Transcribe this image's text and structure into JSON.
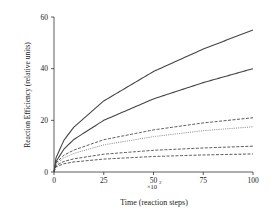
{
  "chart_data": {
    "type": "line",
    "title": "",
    "xlabel": "Time (reaction steps)",
    "x_multiplier": "x10^2",
    "x_multiplier_base": "×10",
    "x_multiplier_exp": "2",
    "ylabel": "Reaction Efficiency  (relative units)",
    "xlim": [
      0,
      100
    ],
    "ylim": [
      0,
      60
    ],
    "xticks": [
      0,
      25,
      50,
      75,
      100
    ],
    "yticks": [
      0,
      20,
      40,
      60
    ],
    "grid": false,
    "legend": null,
    "x": [
      0,
      1,
      5,
      10,
      25,
      50,
      75,
      100
    ],
    "series": [
      {
        "name": "curve-1",
        "style": "solid",
        "values": [
          0,
          5.5,
          12.3,
          17.4,
          27.5,
          38.9,
          47.6,
          55
        ]
      },
      {
        "name": "curve-2",
        "style": "solid",
        "values": [
          0,
          4.0,
          8.9,
          12.6,
          20.0,
          28.3,
          34.6,
          40
        ]
      },
      {
        "name": "curve-3",
        "style": "dashed",
        "values": [
          0,
          3.5,
          6.5,
          8.5,
          12.5,
          16.3,
          19.0,
          21
        ]
      },
      {
        "name": "curve-4",
        "style": "dotted",
        "values": [
          0,
          3.0,
          5.5,
          7.2,
          10.5,
          13.7,
          16.0,
          17.5
        ]
      },
      {
        "name": "curve-5",
        "style": "dashed",
        "values": [
          0,
          2.5,
          4.1,
          5.1,
          6.9,
          8.4,
          9.3,
          10
        ]
      },
      {
        "name": "curve-6",
        "style": "dashed",
        "values": [
          0,
          2.0,
          3.2,
          3.9,
          5.0,
          6.0,
          6.6,
          7
        ]
      }
    ]
  }
}
